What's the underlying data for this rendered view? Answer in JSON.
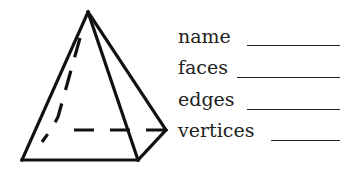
{
  "figure": {
    "shape": "square-pyramid",
    "stroke_color": "#111111",
    "apex": [
      88,
      12
    ],
    "base": {
      "front_left": [
        22,
        160
      ],
      "front_right": [
        138,
        160
      ],
      "back_right": [
        166,
        130
      ],
      "back_left": [
        40,
        130
      ]
    },
    "hidden_edges_style": "dashed"
  },
  "worksheet": {
    "fields": [
      {
        "label": "name",
        "answer": ""
      },
      {
        "label": "faces",
        "answer": ""
      },
      {
        "label": "edges",
        "answer": ""
      },
      {
        "label": "vertices",
        "answer": ""
      }
    ]
  }
}
